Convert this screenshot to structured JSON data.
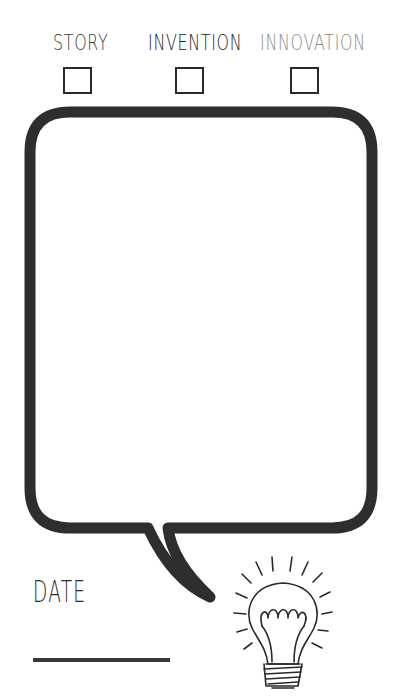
{
  "categories": [
    {
      "label": "STORY",
      "color": "#3a3a3a",
      "checked": false
    },
    {
      "label": "INVENTION",
      "color": "#222222",
      "checked": false
    },
    {
      "label": "INNOVATION",
      "color": "#8a8a8a",
      "checked": false
    }
  ],
  "speech_bubble": {
    "stroke_color": "#2e2e2e",
    "content": ""
  },
  "date": {
    "label": "DATE",
    "value": ""
  },
  "illustration": {
    "icon": "light-bulb-icon"
  }
}
